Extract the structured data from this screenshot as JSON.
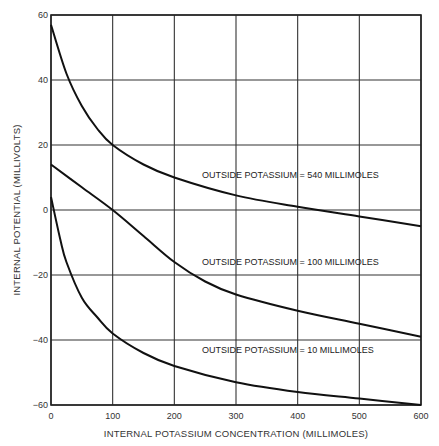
{
  "chart_data": {
    "type": "line",
    "title": "",
    "xlabel": "INTERNAL POTASSIUM CONCENTRATION (MILLIMOLES)",
    "ylabel": "INTERNAL POTENTIAL (MILLIVOLTS)",
    "xlim": [
      0,
      600
    ],
    "ylim": [
      -60,
      60
    ],
    "grid": true,
    "legend": "inline annotations",
    "x_ticks": [
      0,
      100,
      200,
      300,
      400,
      500,
      600
    ],
    "y_ticks": [
      60,
      40,
      20,
      0,
      -20,
      -40,
      -60
    ],
    "x_tick_labels": [
      "0",
      "100",
      "200",
      "300",
      "400",
      "500",
      "600"
    ],
    "y_tick_labels": [
      "60",
      "40",
      "20",
      "0",
      "−20",
      "−40",
      "−60"
    ],
    "series": [
      {
        "name": "OUTSIDE POTASSIUM = 540 MILLIMOLES",
        "x": [
          0,
          25,
          50,
          75,
          100,
          150,
          200,
          300,
          400,
          500,
          600
        ],
        "y": [
          57,
          42,
          32,
          25,
          20,
          14,
          10,
          4.5,
          1,
          -2,
          -5
        ]
      },
      {
        "name": "OUTSIDE POTASSIUM = 100 MILLIMOLES",
        "x": [
          0,
          50,
          100,
          150,
          200,
          250,
          300,
          400,
          500,
          600
        ],
        "y": [
          14,
          7,
          0,
          -8,
          -16,
          -22,
          -26,
          -31,
          -35,
          -39
        ]
      },
      {
        "name": "OUTSIDE POTASSIUM = 10 MILLIMOLES",
        "x": [
          0,
          15,
          25,
          50,
          75,
          100,
          150,
          200,
          300,
          400,
          500,
          600
        ],
        "y": [
          4,
          -9,
          -16,
          -27,
          -33,
          -38,
          -44,
          -48,
          -53,
          -56,
          -58,
          -60
        ]
      }
    ],
    "annotations": [
      {
        "text": "OUTSIDE POTASSIUM = 540 MILLIMOLES",
        "x": 245,
        "y": 10
      },
      {
        "text": "OUTSIDE POTASSIUM = 100 MILLIMOLES",
        "x": 245,
        "y": -17
      },
      {
        "text": "OUTSIDE POTASSIUM = 10 MILLIMOLES",
        "x": 245,
        "y": -44
      }
    ]
  }
}
